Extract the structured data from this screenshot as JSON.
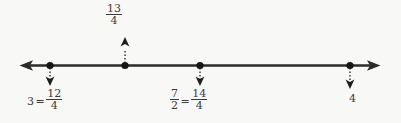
{
  "figure": {
    "type": "number-line",
    "background_color": "#f8f8f6",
    "line_color": "#2b2b2b",
    "text_color": "#3a3a3a",
    "axis": {
      "y": 65,
      "x_start": 20,
      "x_end": 380,
      "left_arrow": true,
      "right_arrow": true
    },
    "points": [
      {
        "id": "point-3",
        "x": 50,
        "value": 3,
        "label_position": "below",
        "arrow_direction": "down",
        "label": {
          "whole": "3",
          "equals": "=",
          "numerator": "12",
          "denominator": "4",
          "plain": "3=12/4"
        }
      },
      {
        "id": "point-13-4",
        "x": 125,
        "value": 3.25,
        "label_position": "above",
        "arrow_direction": "up",
        "label": {
          "whole": "",
          "equals": "",
          "numerator": "13",
          "denominator": "4",
          "plain": "13/4"
        }
      },
      {
        "id": "point-7-2",
        "x": 200,
        "value": 3.5,
        "label_position": "below",
        "arrow_direction": "down",
        "label": {
          "numerator_left": "7",
          "denominator_left": "2",
          "equals": "=",
          "numerator": "14",
          "denominator": "4",
          "plain": "7/2=14/4"
        }
      },
      {
        "id": "point-4",
        "x": 350,
        "value": 4,
        "label_position": "below",
        "arrow_direction": "down",
        "label": {
          "whole": "4",
          "plain": "4"
        }
      }
    ]
  }
}
